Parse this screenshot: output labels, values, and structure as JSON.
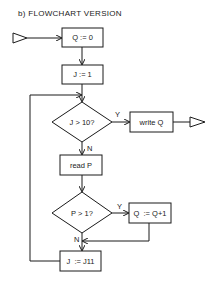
{
  "title": "b)  FLOWCHART VERSION",
  "nodes": {
    "init_q": "Q := 0",
    "init_j": "J := 1",
    "cond_j": "J > 10?",
    "write_q": "write Q",
    "read_p": "read P",
    "cond_p": "P > 1?",
    "incr_q": "Q  := Q+1",
    "incr_j": "J  := J11"
  },
  "edges": {
    "cond_j_yes": "Y",
    "cond_j_no": "N",
    "cond_p_yes": "Y",
    "cond_p_no": "N"
  },
  "colors": {
    "line": "#1a1a1a",
    "background": "#ffffff"
  }
}
